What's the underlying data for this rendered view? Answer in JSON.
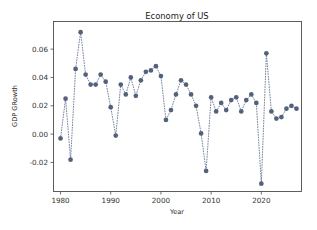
{
  "figure": {
    "background": "#ffffff",
    "plot_background": "#ffffff",
    "frame_color": "#4d4d4d"
  },
  "chart_data": {
    "type": "line",
    "title": "Economy of US",
    "xlabel": "Year",
    "ylabel": "GDP GRowth",
    "xlim": [
      1978.6,
      2028.0
    ],
    "ylim": [
      -0.0405,
      0.0795
    ],
    "xticks": [
      1980,
      1990,
      2000,
      2010,
      2020
    ],
    "xticklabels": [
      "1980",
      "1990",
      "2000",
      "2010",
      "2020"
    ],
    "yticks": [
      -0.02,
      0.0,
      0.02,
      0.04,
      0.06
    ],
    "yticklabels": [
      "-0.02",
      "0.00",
      "0.02",
      "0.04",
      "0.06"
    ],
    "grid": false,
    "legend": null,
    "marker": "o",
    "linestyle": "dotted",
    "color": "#53627c",
    "x": [
      1980,
      1981,
      1982,
      1983,
      1984,
      1985,
      1986,
      1987,
      1988,
      1989,
      1990,
      1991,
      1992,
      1993,
      1994,
      1995,
      1996,
      1997,
      1998,
      1999,
      2000,
      2001,
      2002,
      2003,
      2004,
      2005,
      2006,
      2007,
      2008,
      2009,
      2010,
      2011,
      2012,
      2013,
      2014,
      2015,
      2016,
      2017,
      2018,
      2019,
      2020,
      2021,
      2022,
      2023,
      2024,
      2025,
      2026,
      2027
    ],
    "y": [
      -0.003,
      0.025,
      -0.018,
      0.046,
      0.072,
      0.042,
      0.035,
      0.035,
      0.042,
      0.037,
      0.019,
      -0.001,
      0.035,
      0.028,
      0.04,
      0.027,
      0.038,
      0.044,
      0.045,
      0.048,
      0.041,
      0.01,
      0.017,
      0.028,
      0.038,
      0.035,
      0.028,
      0.02,
      0.0005,
      -0.026,
      0.026,
      0.016,
      0.022,
      0.017,
      0.024,
      0.026,
      0.016,
      0.024,
      0.028,
      0.022,
      -0.035,
      0.057,
      0.016,
      0.011,
      0.012,
      0.018,
      0.02,
      0.018
    ],
    "series": [
      {
        "name": "GDP GRowth",
        "values": [
          -0.003,
          0.025,
          -0.018,
          0.046,
          0.072,
          0.042,
          0.035,
          0.035,
          0.042,
          0.037,
          0.019,
          -0.001,
          0.035,
          0.028,
          0.04,
          0.027,
          0.038,
          0.044,
          0.045,
          0.048,
          0.041,
          0.01,
          0.017,
          0.028,
          0.038,
          0.035,
          0.028,
          0.02,
          0.0005,
          -0.026,
          0.026,
          0.016,
          0.022,
          0.017,
          0.024,
          0.026,
          0.016,
          0.024,
          0.028,
          0.022,
          -0.035,
          0.057,
          0.016,
          0.011,
          0.012,
          0.018,
          0.02,
          0.018
        ]
      }
    ]
  }
}
